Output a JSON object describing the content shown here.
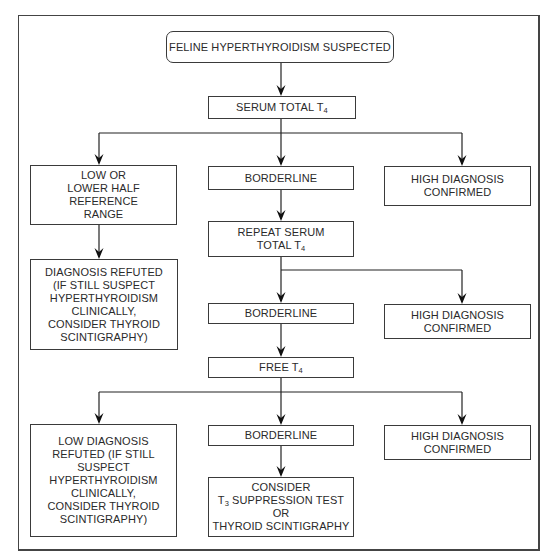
{
  "diagram": {
    "type": "flowchart",
    "nodes": {
      "start": {
        "lines": [
          [
            {
              "t": "FELINE HYPERTHYROIDISM SUSPECTED"
            }
          ]
        ]
      },
      "serum_total_t4": {
        "lines": [
          [
            {
              "t": "SERUM TOTAL T"
            },
            {
              "sub": "4"
            }
          ]
        ]
      },
      "low_1": {
        "lines": [
          [
            {
              "t": "LOW OR"
            }
          ],
          [
            {
              "t": "LOWER HALF"
            }
          ],
          [
            {
              "t": "REFERENCE"
            }
          ],
          [
            {
              "t": "RANGE"
            }
          ]
        ]
      },
      "borderline_1": {
        "lines": [
          [
            {
              "t": "BORDERLINE"
            }
          ]
        ]
      },
      "high_1": {
        "lines": [
          [
            {
              "t": "HIGH DIAGNOSIS"
            }
          ],
          [
            {
              "t": "CONFIRMED"
            }
          ]
        ]
      },
      "diagnosis_refuted_1": {
        "lines": [
          [
            {
              "t": "DIAGNOSIS REFUTED"
            }
          ],
          [
            {
              "t": "(IF STILL SUSPECT"
            }
          ],
          [
            {
              "t": "HYPERTHYROIDISM"
            }
          ],
          [
            {
              "t": "CLINICALLY,"
            }
          ],
          [
            {
              "t": "CONSIDER THYROID"
            }
          ],
          [
            {
              "t": "SCINTIGRAPHY)"
            }
          ]
        ]
      },
      "repeat_serum_total_t4": {
        "lines": [
          [
            {
              "t": "REPEAT SERUM"
            }
          ],
          [
            {
              "t": "TOTAL T"
            },
            {
              "sub": "4"
            }
          ]
        ]
      },
      "borderline_2": {
        "lines": [
          [
            {
              "t": "BORDERLINE"
            }
          ]
        ]
      },
      "high_2": {
        "lines": [
          [
            {
              "t": "HIGH DIAGNOSIS"
            }
          ],
          [
            {
              "t": "CONFIRMED"
            }
          ]
        ]
      },
      "free_t4": {
        "lines": [
          [
            {
              "t": "FREE T"
            },
            {
              "sub": "4"
            }
          ]
        ]
      },
      "low_3": {
        "lines": [
          [
            {
              "t": "LOW DIAGNOSIS"
            }
          ],
          [
            {
              "t": "REFUTED (IF STILL"
            }
          ],
          [
            {
              "t": "SUSPECT"
            }
          ],
          [
            {
              "t": "HYPERTHYROIDISM"
            }
          ],
          [
            {
              "t": "CLINICALLY,"
            }
          ],
          [
            {
              "t": "CONSIDER THYROID"
            }
          ],
          [
            {
              "t": "SCINTIGRAPHY)"
            }
          ]
        ]
      },
      "borderline_3": {
        "lines": [
          [
            {
              "t": "BORDERLINE"
            }
          ]
        ]
      },
      "high_3": {
        "lines": [
          [
            {
              "t": "HIGH DIAGNOSIS"
            }
          ],
          [
            {
              "t": "CONFIRMED"
            }
          ]
        ]
      },
      "consider_t3_or_scintigraphy": {
        "lines": [
          [
            {
              "t": "CONSIDER"
            }
          ],
          [
            {
              "t": "T"
            },
            {
              "sub": "3"
            },
            {
              "t": " SUPPRESSION TEST"
            }
          ],
          [
            {
              "t": "OR"
            }
          ],
          [
            {
              "t": "THYROID SCINTIGRAPHY"
            }
          ]
        ]
      }
    },
    "edges": [
      [
        "start",
        "serum_total_t4"
      ],
      [
        "serum_total_t4",
        "low_1"
      ],
      [
        "serum_total_t4",
        "borderline_1"
      ],
      [
        "serum_total_t4",
        "high_1"
      ],
      [
        "low_1",
        "diagnosis_refuted_1"
      ],
      [
        "borderline_1",
        "repeat_serum_total_t4"
      ],
      [
        "repeat_serum_total_t4",
        "borderline_2"
      ],
      [
        "repeat_serum_total_t4",
        "high_2"
      ],
      [
        "borderline_2",
        "free_t4"
      ],
      [
        "free_t4",
        "low_3"
      ],
      [
        "free_t4",
        "borderline_3"
      ],
      [
        "free_t4",
        "high_3"
      ],
      [
        "borderline_3",
        "consider_t3_or_scintigraphy"
      ]
    ]
  }
}
